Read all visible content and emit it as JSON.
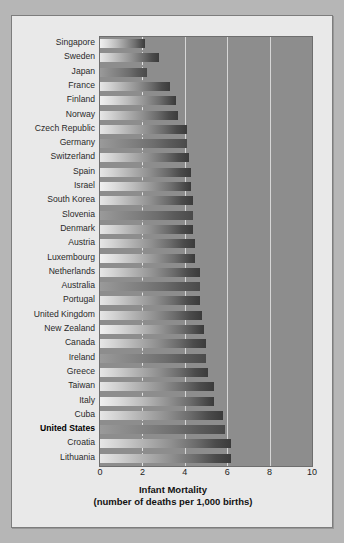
{
  "chart_data": {
    "type": "bar",
    "orientation": "horizontal",
    "title": "",
    "xlabel": "Infant Mortality",
    "xlabel_sub": "(number of deaths per 1,000 births)",
    "ylabel": "",
    "xlim": [
      0,
      10
    ],
    "xticks": [
      0,
      2,
      4,
      6,
      8,
      10
    ],
    "xtick_labels": [
      "0",
      "2",
      "4",
      "6",
      "8",
      "10"
    ],
    "grid": true,
    "gridlines": [
      2,
      4,
      6,
      8
    ],
    "legend": null,
    "highlight_category": "United States",
    "categories": [
      "Singapore",
      "Sweden",
      "Japan",
      "France",
      "Finland",
      "Norway",
      "Czech Republic",
      "Germany",
      "Switzerland",
      "Spain",
      "Israel",
      "South Korea",
      "Slovenia",
      "Denmark",
      "Austria",
      "Luxembourg",
      "Netherlands",
      "Australia",
      "Portugal",
      "United Kingdom",
      "New Zealand",
      "Canada",
      "Ireland",
      "Greece",
      "Taiwan",
      "Italy",
      "Cuba",
      "United States",
      "Croatia",
      "Lithuania"
    ],
    "values": [
      2.1,
      2.8,
      2.2,
      3.3,
      3.6,
      3.7,
      4.1,
      4.1,
      4.2,
      4.3,
      4.3,
      4.4,
      4.4,
      4.4,
      4.5,
      4.5,
      4.7,
      4.7,
      4.7,
      4.8,
      4.9,
      5.0,
      5.0,
      5.1,
      5.4,
      5.4,
      5.8,
      5.9,
      6.2,
      6.2
    ],
    "values_display": [
      "2.1",
      "2.8",
      "2.2",
      "3.3",
      "3.6",
      "3.7",
      "4.1",
      "4.1",
      "4.2",
      "4.3",
      "4.3",
      "4.4",
      "4.4",
      "4.4",
      "4.5",
      "4.5",
      "4.7",
      "4.7",
      "4.7",
      "4.8",
      "4.9",
      "5.0",
      "5.0",
      "5.1",
      "5.4",
      "5.4",
      "5.8",
      "5.9",
      "6.2",
      "6.2"
    ]
  },
  "colors": {
    "page_background": "#b6b6b6",
    "panel_background": "#e9e9e9",
    "plot_background": "#8d8d8d",
    "gridline": "#d6d6d6",
    "bar_light": "#e6e6e6",
    "bar_dark": "#3b3b3b",
    "text": "#2a2a2a",
    "frame_border": "#7d7d7d"
  }
}
